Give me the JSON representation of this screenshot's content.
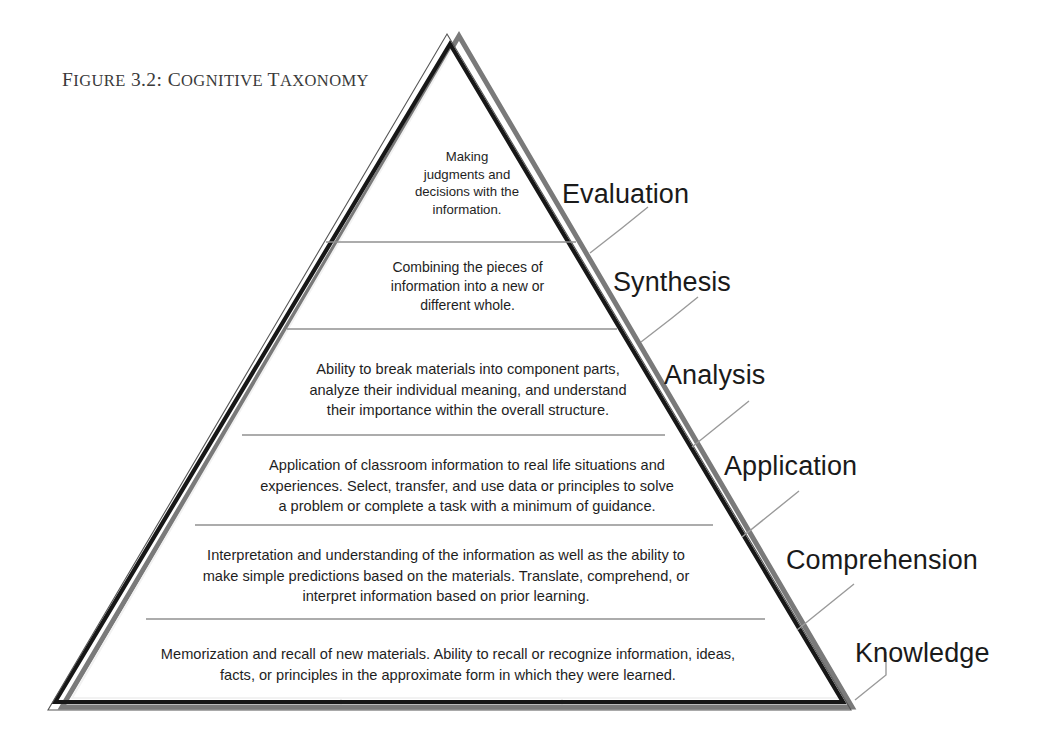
{
  "figure": {
    "caption_prefix": "F",
    "caption": "IGURE 3.2: C",
    "caption_full": "FIGURE 3.2: COGNITIVE TAXONOMY",
    "caption_parts": {
      "f": "F",
      "igure": "IGURE",
      "number": " 3.2: ",
      "c": "C",
      "ognitive": "OGNITIVE",
      "space": " ",
      "t": "T",
      "axonomy": "AXONOMY"
    },
    "shape": "triangle-pyramid",
    "orientation": "apex-top"
  },
  "colors": {
    "background": "#ffffff",
    "outline_dark": "#1a1a1a",
    "outline_shadow": "#6e6e6e",
    "tier_divider": "#8c8c8c",
    "ghost_guide": "#d8d8d8",
    "tick_line": "#9a9a9a",
    "text": "#1e1e1e",
    "caption_text": "#3a3a3a"
  },
  "levels": [
    {
      "id": "evaluation",
      "rank": 6,
      "label": "Evaluation",
      "description": "Making\njudgments and\ndecisions with the\ninformation."
    },
    {
      "id": "synthesis",
      "rank": 5,
      "label": "Synthesis",
      "description": "Combining the pieces of\ninformation into a new or\ndifferent whole."
    },
    {
      "id": "analysis",
      "rank": 4,
      "label": "Analysis",
      "description": "Ability to break materials into component parts,\nanalyze their individual meaning, and understand\ntheir importance within the overall structure."
    },
    {
      "id": "application",
      "rank": 3,
      "label": "Application",
      "description": "Application of classroom information to real life situations and\nexperiences. Select, transfer, and use data or principles to solve\na problem or complete a task with a minimum of guidance."
    },
    {
      "id": "comprehension",
      "rank": 2,
      "label": "Comprehension",
      "description": "Interpretation and understanding of the information as well as the ability to\nmake simple predictions based on the materials. Translate, comprehend, or\ninterpret information based on prior learning."
    },
    {
      "id": "knowledge",
      "rank": 1,
      "label": "Knowledge",
      "description": "Memorization and recall of new materials. Ability to recall or recognize information, ideas,\nfacts, or principles in the approximate form in which they were learned."
    }
  ]
}
